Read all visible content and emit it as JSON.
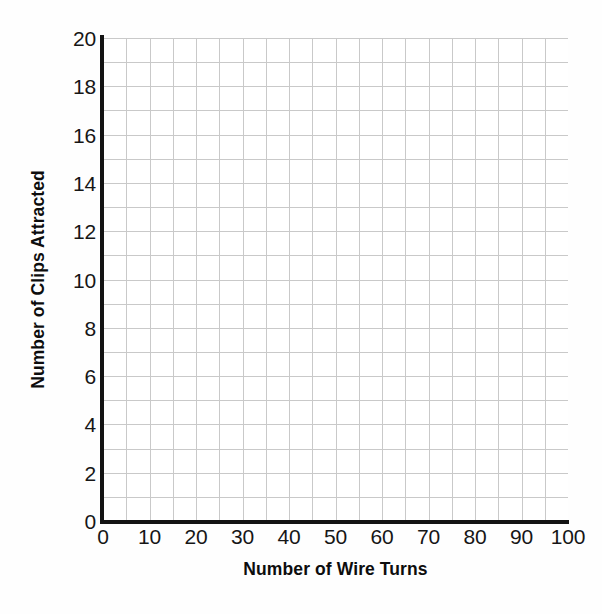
{
  "chart_data": {
    "type": "line",
    "title": "",
    "subtitle": "",
    "xlabel": "Number of Wire Turns",
    "ylabel": "Number of Clips Attracted",
    "xlim": [
      0,
      100
    ],
    "ylim": [
      0,
      20
    ],
    "xticks": [
      0,
      10,
      20,
      30,
      40,
      50,
      60,
      70,
      80,
      90,
      100
    ],
    "yticks": [
      0,
      2,
      4,
      6,
      8,
      10,
      12,
      14,
      16,
      18,
      20
    ],
    "xtick_labels": [
      "0",
      "10",
      "20",
      "30",
      "40",
      "50",
      "60",
      "70",
      "80",
      "90",
      "100"
    ],
    "ytick_labels": [
      "0",
      "2",
      "4",
      "6",
      "8",
      "10",
      "12",
      "14",
      "16",
      "18",
      "20"
    ],
    "x_minor_step": 5,
    "y_minor_step": 1,
    "x_minor_divisions": 20,
    "y_minor_divisions": 20,
    "grid": true,
    "grid_color": "#c9c9c9",
    "axis_color": "#131313",
    "background": "#ffffff",
    "legend": null,
    "legend_position": "none",
    "annotations": [],
    "series": [],
    "values": [],
    "categories": [],
    "note": "Blank plotting grid with no data points drawn; axes and gridlines only."
  },
  "axes": {
    "x_title": "Number of Wire Turns",
    "y_title": "Number of Clips Attracted"
  },
  "ticks": {
    "x": [
      "0",
      "10",
      "20",
      "30",
      "40",
      "50",
      "60",
      "70",
      "80",
      "90",
      "100"
    ],
    "y": [
      "0",
      "2",
      "4",
      "6",
      "8",
      "10",
      "12",
      "14",
      "16",
      "18",
      "20"
    ]
  }
}
